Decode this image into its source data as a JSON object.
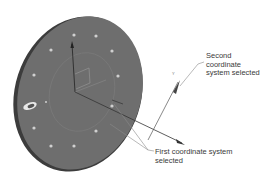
{
  "figure": {
    "labels": {
      "second_coordinate_system": "Second\ncoordinate\nsystem selected",
      "first_coordinate_system": "First coordinate system\nselected"
    },
    "axis_letters": {
      "disc_z": "Z",
      "second_z": "Y"
    },
    "colors": {
      "disc_face": "#6e6e6e",
      "disc_edge": "#3c3c3c",
      "hole": "#d8d8d8",
      "leader_line": "#8a8a8a",
      "arrow": "#555555",
      "text": "#3a3a3a"
    },
    "hole_count": 12
  }
}
